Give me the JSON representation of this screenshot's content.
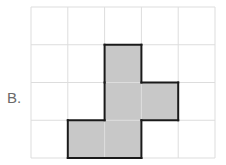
{
  "label": "B.",
  "grid": {
    "cols": 5,
    "rows": 4,
    "x0": 31,
    "y0": 7,
    "cell_w": 36.8,
    "cell_h": 37.75,
    "line_color": "#dddddd"
  },
  "shape": {
    "fill": "#c8c8c8",
    "stroke": "#1a1a1a",
    "cells": [
      [
        2,
        1
      ],
      [
        2,
        2
      ],
      [
        3,
        2
      ],
      [
        1,
        3
      ],
      [
        2,
        3
      ]
    ]
  }
}
